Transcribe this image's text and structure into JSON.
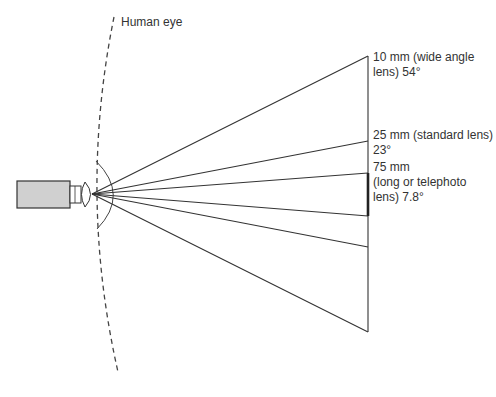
{
  "diagram": {
    "labels": {
      "human_eye": "Human eye",
      "wide": {
        "line1": "10 mm (wide angle",
        "line2": "lens) 54°"
      },
      "standard": {
        "line1": "25 mm (standard lens)",
        "line2": "23°"
      },
      "telephoto": {
        "line1": "75 mm",
        "line2": "(long or telephoto",
        "line3": "lens) 7.8°"
      }
    },
    "lenses": [
      {
        "focal_length": "10 mm",
        "type": "wide angle lens",
        "angle": "54°"
      },
      {
        "focal_length": "25 mm",
        "type": "standard lens",
        "angle": "23°"
      },
      {
        "focal_length": "75 mm",
        "type": "long or telephoto lens",
        "angle": "7.8°"
      }
    ],
    "colors": {
      "line": "#333333",
      "camera_fill": "#d0d0d0",
      "text": "#333333"
    }
  }
}
